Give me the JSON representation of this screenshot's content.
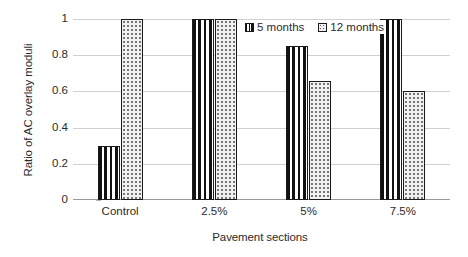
{
  "chart_data": {
    "type": "bar",
    "title": "",
    "xlabel": "Pavement sections",
    "ylabel": "Ratio of AC overlay moduli",
    "categories": [
      "Control",
      "2.5%",
      "5%",
      "7.5%"
    ],
    "series": [
      {
        "name": "5 months",
        "values": [
          0.3,
          1.0,
          0.85,
          1.0
        ]
      },
      {
        "name": "12 months",
        "values": [
          1.0,
          1.0,
          0.655,
          0.6
        ]
      }
    ],
    "ylim": [
      0,
      1
    ],
    "yticks": [
      "0",
      "0.2",
      "0.4",
      "0.6",
      "0.8",
      "1"
    ],
    "ytick_values": [
      0,
      0.2,
      0.4,
      0.6,
      0.8,
      1
    ],
    "grid": true,
    "legend_position": "top-right-inside",
    "legend": [
      {
        "label": "5 months",
        "pattern": "vertical-stripes"
      },
      {
        "label": "12 months",
        "pattern": "dotted-speckle"
      }
    ],
    "colors": {
      "series_0_fill": "#111111",
      "series_1_fill": "#f1f1f1",
      "gridline": "#d0d0d0",
      "axis": "#9a9a9a",
      "text": "#2b2b2b",
      "background": "#ffffff"
    }
  }
}
